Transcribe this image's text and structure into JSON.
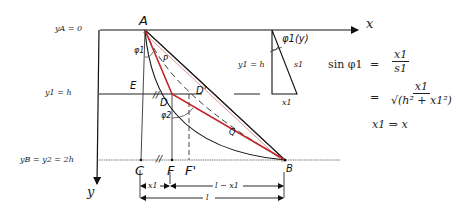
{
  "diagram": {
    "axes": {
      "x_label": "x",
      "y_label": "y"
    },
    "left_levels": [
      {
        "label": "y_A = 0",
        "display": "yA = 0"
      },
      {
        "label": "y_1 = h",
        "display": "y1 = h"
      },
      {
        "label": "y_B = y_2 = 2h",
        "display": "yB = y2 = 2h"
      }
    ],
    "points": {
      "A": "A",
      "B": "B",
      "C": "C",
      "D": "D",
      "D_prime": "D'",
      "E": "E",
      "F": "F",
      "F_prime": "F'",
      "P": "P",
      "Q": "Q"
    },
    "angles": {
      "phi1": "φ1",
      "phi2": "φ2",
      "phi1_y": "φ1(y)"
    },
    "dimensions": {
      "x1": "x1",
      "l_minus_x1": "l − x1",
      "l": "l"
    },
    "inset_triangle": {
      "height_label": "y1 = h",
      "hyp_label": "s1",
      "base_label": "x1",
      "angle_label": "φ1(y)"
    },
    "equations": {
      "lhs": "sin φ1",
      "eq1_num": "x1",
      "eq1_den": "s1",
      "eq2_num": "x1",
      "eq2_den": "√(h² + x1²)",
      "line3": "x1 ⇒ x"
    },
    "colors": {
      "ink": "#1a1a1a",
      "path_red": "#c0262a",
      "background": "#ffffff"
    }
  }
}
